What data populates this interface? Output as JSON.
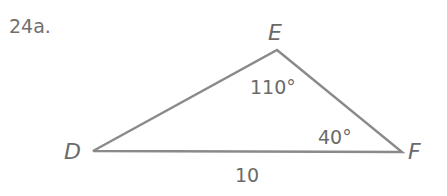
{
  "problem_label": "24a.",
  "triangle": {
    "vertices": [
      {
        "name": "D",
        "x": 93,
        "y": 151
      },
      {
        "name": "E",
        "x": 277,
        "y": 50
      },
      {
        "name": "F",
        "x": 402,
        "y": 152
      }
    ],
    "angles": {
      "E": "110°",
      "F": "40°"
    },
    "sides": {
      "DF": "10"
    },
    "stroke_color": "#8a8a8a",
    "label_color": "#6a6a6a"
  }
}
